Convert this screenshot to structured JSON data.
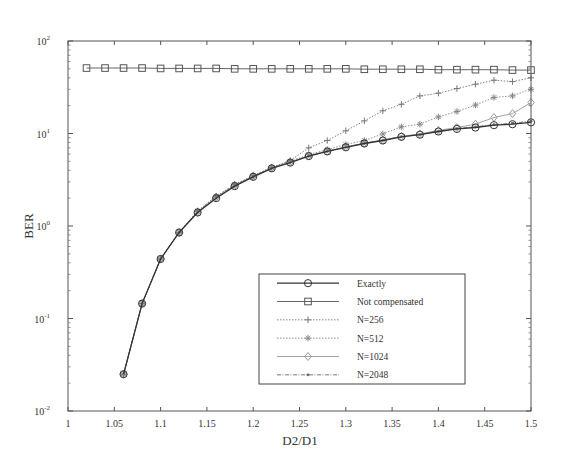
{
  "chart_data": {
    "type": "line",
    "title": "",
    "xlabel": "D2/D1",
    "ylabel": "BER",
    "xlim": [
      1,
      1.5
    ],
    "ylim": [
      0.01,
      100
    ],
    "yscale": "log",
    "grid": false,
    "legend_position": "lower right (inside)",
    "xticks": [
      "1",
      "1.05",
      "1.1",
      "1.15",
      "1.2",
      "1.25",
      "1.3",
      "1.35",
      "1.4",
      "1.45",
      "1.5"
    ],
    "yticks": [
      {
        "base": "10",
        "exp": "2"
      },
      {
        "base": "10",
        "exp": "1"
      },
      {
        "base": "10",
        "exp": "0"
      },
      {
        "base": "10",
        "exp": "-1"
      },
      {
        "base": "10",
        "exp": "-2"
      }
    ],
    "series": [
      {
        "name": "Exactly",
        "marker": "circle",
        "line": "solid",
        "color": "#333333",
        "x": [
          1.06,
          1.08,
          1.1,
          1.12,
          1.14,
          1.16,
          1.18,
          1.2,
          1.22,
          1.24,
          1.26,
          1.28,
          1.3,
          1.32,
          1.34,
          1.36,
          1.38,
          1.4,
          1.42,
          1.44,
          1.46,
          1.48,
          1.5
        ],
        "values": [
          0.025,
          0.145,
          0.44,
          0.85,
          1.4,
          2.0,
          2.7,
          3.4,
          4.2,
          4.85,
          5.7,
          6.4,
          7.1,
          7.8,
          8.4,
          9.2,
          9.7,
          10.5,
          11.2,
          11.6,
          12.3,
          12.6,
          13.2
        ]
      },
      {
        "name": "Not compensated",
        "marker": "square",
        "line": "solid",
        "color": "#555555",
        "x": [
          1.02,
          1.04,
          1.06,
          1.08,
          1.1,
          1.12,
          1.14,
          1.16,
          1.18,
          1.2,
          1.22,
          1.24,
          1.26,
          1.28,
          1.3,
          1.32,
          1.34,
          1.36,
          1.38,
          1.4,
          1.42,
          1.44,
          1.46,
          1.48,
          1.5
        ],
        "values": [
          51,
          51,
          51,
          51,
          50.5,
          50.5,
          50.5,
          50.5,
          50,
          50,
          50,
          50,
          50,
          50,
          50,
          49.5,
          49.5,
          49.5,
          49.5,
          49,
          49,
          49,
          49,
          48.5,
          48.5
        ]
      },
      {
        "name": "N=256",
        "marker": "plus",
        "line": "dotted",
        "color": "#777777",
        "x": [
          1.06,
          1.08,
          1.1,
          1.12,
          1.14,
          1.16,
          1.18,
          1.2,
          1.22,
          1.24,
          1.26,
          1.28,
          1.3,
          1.32,
          1.34,
          1.36,
          1.38,
          1.4,
          1.42,
          1.44,
          1.46,
          1.48,
          1.5
        ],
        "values": [
          0.025,
          0.145,
          0.44,
          0.85,
          1.45,
          2.1,
          2.8,
          3.5,
          4.3,
          5.1,
          7.0,
          8.4,
          10.7,
          13.7,
          17.6,
          20.7,
          25.5,
          27.3,
          30.6,
          34.1,
          37.7,
          36.4,
          40
        ]
      },
      {
        "name": "N=512",
        "marker": "asterisk",
        "line": "dotted",
        "color": "#888888",
        "x": [
          1.06,
          1.08,
          1.1,
          1.12,
          1.14,
          1.16,
          1.18,
          1.2,
          1.22,
          1.24,
          1.26,
          1.28,
          1.3,
          1.32,
          1.34,
          1.36,
          1.38,
          1.4,
          1.42,
          1.44,
          1.46,
          1.48,
          1.5
        ],
        "values": [
          0.025,
          0.145,
          0.44,
          0.85,
          1.45,
          2.1,
          2.8,
          3.5,
          4.3,
          5.0,
          5.9,
          6.7,
          7.6,
          8.4,
          9.9,
          11.8,
          12.6,
          15.1,
          17.3,
          20.3,
          24.5,
          25.5,
          30.1
        ]
      },
      {
        "name": "N=1024",
        "marker": "diamond",
        "line": "solid",
        "color": "#999999",
        "x": [
          1.06,
          1.08,
          1.1,
          1.12,
          1.14,
          1.16,
          1.18,
          1.2,
          1.22,
          1.24,
          1.26,
          1.28,
          1.3,
          1.32,
          1.34,
          1.36,
          1.38,
          1.4,
          1.42,
          1.44,
          1.46,
          1.48,
          1.5
        ],
        "values": [
          0.025,
          0.145,
          0.44,
          0.85,
          1.42,
          2.05,
          2.75,
          3.45,
          4.25,
          4.9,
          5.75,
          6.45,
          7.15,
          7.85,
          8.5,
          9.3,
          9.9,
          10.8,
          11.6,
          12.6,
          14.9,
          16.4,
          21.6
        ]
      },
      {
        "name": "N=2048",
        "marker": "dot",
        "line": "dashdot",
        "color": "#666666",
        "x": [
          1.06,
          1.08,
          1.1,
          1.12,
          1.14,
          1.16,
          1.18,
          1.2,
          1.22,
          1.24,
          1.26,
          1.28,
          1.3,
          1.32,
          1.34,
          1.36,
          1.38,
          1.4,
          1.42,
          1.44,
          1.46,
          1.48,
          1.5
        ],
        "values": [
          0.025,
          0.145,
          0.44,
          0.85,
          1.41,
          2.02,
          2.72,
          3.42,
          4.2,
          4.88,
          5.72,
          6.42,
          7.12,
          7.82,
          8.45,
          9.25,
          9.75,
          10.6,
          11.3,
          11.8,
          12.5,
          12.9,
          13.6
        ]
      }
    ]
  },
  "layout": {
    "plot_left": 68,
    "plot_top": 41,
    "plot_right": 531,
    "plot_bottom": 411,
    "legend": {
      "x": 259,
      "y": 274,
      "w": 206,
      "h": 110
    }
  }
}
